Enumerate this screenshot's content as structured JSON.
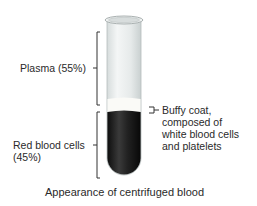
{
  "figure": {
    "caption": "Appearance of centrifuged blood",
    "labels": {
      "plasma": "Plasma (55%)",
      "rbc_line1": "Red blood cells",
      "rbc_line2": "(45%)",
      "buffy_line1": "Buffy coat,",
      "buffy_line2": "composed of",
      "buffy_line3": "white blood cells",
      "buffy_line4": "and platelets"
    },
    "colors": {
      "plasma": "#e8ecec",
      "buffy": "#f7f7f4",
      "rbc": "#1c1c1c",
      "bracket": "#333333"
    }
  }
}
